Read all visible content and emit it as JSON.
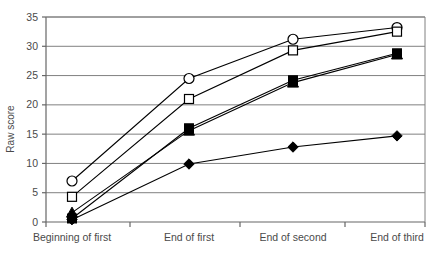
{
  "chart_data": {
    "type": "line",
    "title": "",
    "xlabel": "",
    "ylabel": "Raw score",
    "ylim": [
      0,
      35
    ],
    "yticks": [
      0,
      5,
      10,
      15,
      20,
      25,
      30,
      35
    ],
    "ytick_labels": [
      "0",
      "5",
      "10",
      "15",
      "20",
      "25",
      "30",
      "35"
    ],
    "grid": true,
    "grid_axis": "y",
    "legend": "none",
    "categories": [
      "Beginning of first",
      "End of first",
      "End of second",
      "End of third"
    ],
    "series": [
      {
        "name": "open-circle",
        "marker": "circle-open",
        "values": [
          7.0,
          24.5,
          31.2,
          33.2
        ]
      },
      {
        "name": "open-square",
        "marker": "square-open",
        "values": [
          4.3,
          21.0,
          29.3,
          32.5
        ]
      },
      {
        "name": "filled-square",
        "marker": "square-filled",
        "values": [
          0.6,
          16.0,
          24.2,
          28.8
        ]
      },
      {
        "name": "filled-triangle",
        "marker": "triangle-filled",
        "values": [
          1.6,
          15.6,
          23.8,
          28.6
        ]
      },
      {
        "name": "filled-diamond",
        "marker": "diamond-filled",
        "values": [
          0.4,
          9.9,
          12.8,
          14.7
        ]
      }
    ]
  },
  "colors": {
    "line": "#000000",
    "grid": "#808080",
    "frame": "#666666",
    "text": "#4a4a4a",
    "marker_fill_open": "#ffffff",
    "marker_fill_solid": "#000000"
  }
}
